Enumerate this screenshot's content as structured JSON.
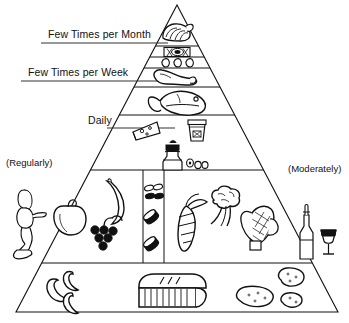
{
  "diagram": {
    "type": "food-pyramid",
    "stroke_color": "#000000",
    "background_color": "#ffffff",
    "frequency_labels": [
      {
        "id": "few-times-per-month",
        "text": "Few Times per Month",
        "underlined": true
      },
      {
        "id": "few-times-per-week",
        "text": "Few Times per Week",
        "underlined": true
      },
      {
        "id": "daily",
        "text": "Daily",
        "underlined": false
      }
    ],
    "side_labels": [
      {
        "id": "regularly",
        "text": "(Regularly)",
        "side": "left"
      },
      {
        "id": "moderately",
        "text": "(Moderately)",
        "side": "right"
      }
    ],
    "tiers": [
      {
        "id": "tier-sweets",
        "name": "Sweets",
        "frequency": "Few Times per Month",
        "icons": [
          "pastry-icon"
        ]
      },
      {
        "id": "tier-red-meat",
        "name": "Red Meat",
        "frequency": "Few Times per Month",
        "icons": [
          "meat-cut-icon"
        ]
      },
      {
        "id": "tier-eggs",
        "name": "Eggs",
        "frequency": "Few Times per Month",
        "icons": [
          "egg-icon",
          "egg-icon",
          "egg-icon"
        ]
      },
      {
        "id": "tier-poultry",
        "name": "Poultry",
        "frequency": "Few Times per Week",
        "icons": [
          "poultry-leg-icon"
        ]
      },
      {
        "id": "tier-fish",
        "name": "Fish",
        "frequency": "Few Times per Week",
        "icons": [
          "fish-icon"
        ]
      },
      {
        "id": "tier-dairy",
        "name": "Cheese and Yogurt",
        "frequency": "Daily",
        "icons": [
          "cheese-wedge-icon",
          "yogurt-container-icon"
        ]
      },
      {
        "id": "tier-olive-oil",
        "name": "Olive Oil",
        "frequency": "Daily",
        "icons": [
          "olive-oil-bottle-icon",
          "olives-icon"
        ]
      },
      {
        "id": "tier-produce",
        "name": "Fruits, Vegetables, Beans and Nuts",
        "frequency": "Daily",
        "icons": [
          "bell-pepper-icon",
          "banana-icon",
          "grapes-icon",
          "beans-icon",
          "nuts-icon",
          "carrot-icon",
          "broccoli-icon",
          "corn-icon"
        ]
      },
      {
        "id": "tier-grains",
        "name": "Breads, Pasta, Rice, Couscous, Polenta, Potatoes",
        "frequency": "Daily",
        "icons": [
          "pasta-icon",
          "bread-loaf-icon",
          "potato-icon"
        ]
      }
    ],
    "flanking_figures": [
      {
        "id": "physical-activity",
        "icon": "exercising-person-icon",
        "side": "left",
        "relates_to": "(Regularly)"
      },
      {
        "id": "wine",
        "icon": "wine-bottle-and-glass-icon",
        "side": "right",
        "relates_to": "(Moderately)"
      }
    ]
  }
}
